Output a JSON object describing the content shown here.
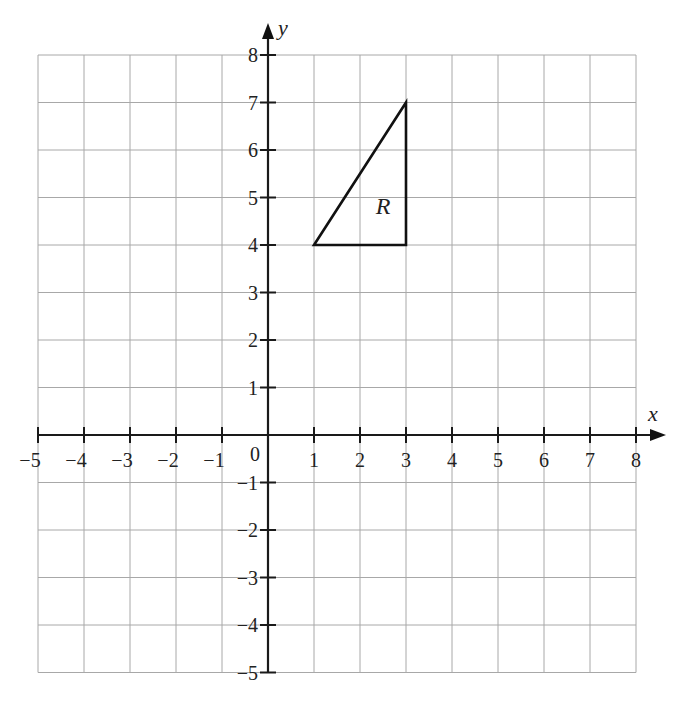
{
  "chart_data": {
    "type": "scatter",
    "title": "",
    "xlabel": "x",
    "ylabel": "y",
    "xlim": [
      -5,
      8
    ],
    "ylim": [
      -5,
      8
    ],
    "grid": true,
    "x_ticks": [
      -5,
      -4,
      -3,
      -2,
      -1,
      1,
      2,
      3,
      4,
      5,
      6,
      7,
      8
    ],
    "y_ticks": [
      -5,
      -4,
      -3,
      -2,
      -1,
      1,
      2,
      3,
      4,
      5,
      6,
      7,
      8
    ],
    "origin_label": "0",
    "shapes": [
      {
        "name": "R",
        "kind": "triangle",
        "vertices": [
          [
            1,
            4
          ],
          [
            3,
            4
          ],
          [
            3,
            7
          ]
        ],
        "label_position": [
          2.5,
          4.65
        ]
      }
    ]
  },
  "labels": {
    "x_axis": "x",
    "y_axis": "y",
    "origin": "0",
    "shape": "R"
  }
}
